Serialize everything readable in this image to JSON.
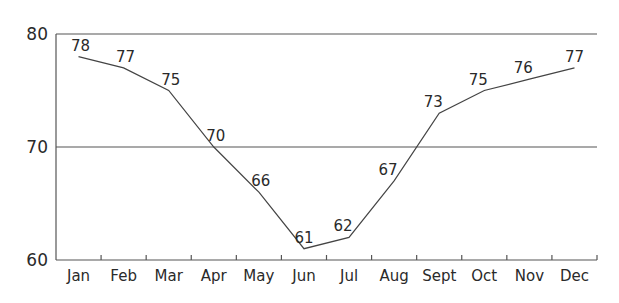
{
  "chart_data": {
    "type": "line",
    "title": "",
    "xlabel": "",
    "ylabel": "",
    "categories": [
      "Jan",
      "Feb",
      "Mar",
      "Apr",
      "May",
      "Jun",
      "Jul",
      "Aug",
      "Sept",
      "Oct",
      "Nov",
      "Dec"
    ],
    "series": [
      {
        "name": "",
        "values": [
          78,
          77,
          75,
          70,
          66,
          61,
          62,
          67,
          73,
          75,
          76,
          77
        ]
      }
    ],
    "data_labels": [
      "78",
      "77",
      "75",
      "70",
      "66",
      "61",
      "62",
      "67",
      "73",
      "75",
      "76",
      "77"
    ],
    "ylim": [
      60,
      80
    ],
    "yticks": [
      60,
      70,
      80
    ],
    "ytick_labels": [
      "60",
      "70",
      "80"
    ],
    "grid": {
      "horizontal": true,
      "vertical": false
    },
    "legend": null,
    "line_color": "#444444"
  }
}
